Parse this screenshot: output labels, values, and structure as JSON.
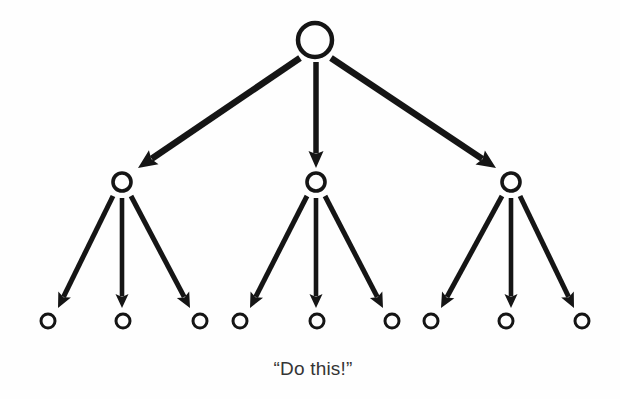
{
  "diagram": {
    "background_color": "#fefefe",
    "ink_color": "#151515",
    "caption": {
      "text": "“Do this!”",
      "x": 313,
      "y": 375,
      "color": "#353535",
      "font_size": 19
    },
    "levels": [
      {
        "name": "root-level",
        "index": 0,
        "radius": 17,
        "stroke_width": 4.5,
        "nodes": [
          {
            "id": "root",
            "label": "",
            "cx": 315,
            "cy": 40
          }
        ]
      },
      {
        "name": "middle-level",
        "index": 1,
        "radius": 9,
        "stroke_width": 3.6,
        "nodes": [
          {
            "id": "m1",
            "label": "",
            "cx": 122,
            "cy": 182
          },
          {
            "id": "m2",
            "label": "",
            "cx": 316,
            "cy": 182
          },
          {
            "id": "m3",
            "label": "",
            "cx": 511,
            "cy": 182
          }
        ]
      },
      {
        "name": "leaf-level",
        "index": 2,
        "radius": 7,
        "stroke_width": 3.0,
        "nodes": [
          {
            "id": "l1",
            "label": "",
            "cx": 48,
            "cy": 321
          },
          {
            "id": "l2",
            "label": "",
            "cx": 123,
            "cy": 321
          },
          {
            "id": "l3",
            "label": "",
            "cx": 200,
            "cy": 321
          },
          {
            "id": "l4",
            "label": "",
            "cx": 240,
            "cy": 321
          },
          {
            "id": "l5",
            "label": "",
            "cx": 317,
            "cy": 321
          },
          {
            "id": "l6",
            "label": "",
            "cx": 392,
            "cy": 321
          },
          {
            "id": "l7",
            "label": "",
            "cx": 431,
            "cy": 321
          },
          {
            "id": "l8",
            "label": "",
            "cx": 506,
            "cy": 321
          },
          {
            "id": "l9",
            "label": "",
            "cx": 582,
            "cy": 321
          }
        ]
      }
    ],
    "edges": [
      {
        "id": "e-root-m1",
        "from": "root",
        "to": "m1",
        "x1": 300,
        "y1": 58,
        "x2": 138,
        "y2": 168,
        "width": 6.5,
        "head_w": 17,
        "head_l": 19
      },
      {
        "id": "e-root-m2",
        "from": "root",
        "to": "m2",
        "x1": 316,
        "y1": 62,
        "x2": 316,
        "y2": 168,
        "width": 5.5,
        "head_w": 15,
        "head_l": 17
      },
      {
        "id": "e-root-m3",
        "from": "root",
        "to": "m3",
        "x1": 331,
        "y1": 58,
        "x2": 496,
        "y2": 168,
        "width": 6.5,
        "head_w": 17,
        "head_l": 19
      },
      {
        "id": "e-m1-l1",
        "from": "m1",
        "to": "l1",
        "x1": 113,
        "y1": 196,
        "x2": 58,
        "y2": 308,
        "width": 5.0,
        "head_w": 14,
        "head_l": 15
      },
      {
        "id": "e-m1-l2",
        "from": "m1",
        "to": "l2",
        "x1": 122,
        "y1": 198,
        "x2": 122,
        "y2": 308,
        "width": 4.6,
        "head_w": 13,
        "head_l": 14
      },
      {
        "id": "e-m1-l3",
        "from": "m1",
        "to": "l3",
        "x1": 131,
        "y1": 196,
        "x2": 190,
        "y2": 308,
        "width": 5.0,
        "head_w": 14,
        "head_l": 15
      },
      {
        "id": "e-m2-l4",
        "from": "m2",
        "to": "l4",
        "x1": 307,
        "y1": 196,
        "x2": 250,
        "y2": 308,
        "width": 5.0,
        "head_w": 14,
        "head_l": 15
      },
      {
        "id": "e-m2-l5",
        "from": "m2",
        "to": "l5",
        "x1": 316,
        "y1": 198,
        "x2": 316,
        "y2": 308,
        "width": 4.6,
        "head_w": 13,
        "head_l": 14
      },
      {
        "id": "e-m2-l6",
        "from": "m2",
        "to": "l6",
        "x1": 325,
        "y1": 196,
        "x2": 383,
        "y2": 308,
        "width": 5.0,
        "head_w": 14,
        "head_l": 15
      },
      {
        "id": "e-m3-l7",
        "from": "m3",
        "to": "l7",
        "x1": 502,
        "y1": 196,
        "x2": 441,
        "y2": 308,
        "width": 5.0,
        "head_w": 14,
        "head_l": 15
      },
      {
        "id": "e-m3-l8",
        "from": "m3",
        "to": "l8",
        "x1": 511,
        "y1": 198,
        "x2": 511,
        "y2": 308,
        "width": 4.6,
        "head_w": 13,
        "head_l": 14
      },
      {
        "id": "e-m3-l9",
        "from": "m3",
        "to": "l9",
        "x1": 520,
        "y1": 196,
        "x2": 574,
        "y2": 308,
        "width": 5.0,
        "head_w": 14,
        "head_l": 15
      }
    ]
  }
}
